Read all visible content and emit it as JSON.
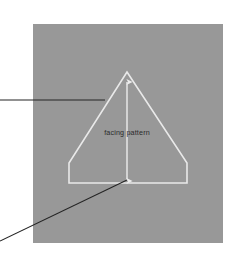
{
  "figure": {
    "panel": {
      "name": "gray-background-panel",
      "fill": "#989898",
      "x": 33,
      "y": 24,
      "width": 190,
      "height": 219
    },
    "shape": {
      "name": "facing-pattern-outline",
      "description": "triangle with truncated lower corners",
      "stroke": "#e9e9e9",
      "stroke_width": 1.6,
      "points": "127,72 187,163 187,183 69,183 69,163",
      "apex": {
        "x": 127,
        "y": 72
      },
      "base_y": 183,
      "base_left_x": 69,
      "base_right_x": 187,
      "shoulder_y": 163
    },
    "dimension_arrow": {
      "name": "height-dimension-arrow",
      "stroke": "#ededed",
      "stroke_width": 1.4,
      "x": 127,
      "y_top": 82,
      "y_bottom": 181,
      "double_headed": true,
      "label": "facing pattern",
      "label_x": 127,
      "label_y": 135,
      "label_color": "#2b2b2b",
      "label_font_size": 7.2
    },
    "leader_lines": [
      {
        "name": "leader-line-upper",
        "stroke": "#242424",
        "stroke_width": 1.1,
        "x1": 0,
        "y1": 100,
        "x2": 105,
        "y2": 100
      },
      {
        "name": "leader-line-lower",
        "stroke": "#242424",
        "stroke_width": 1.1,
        "x1": 0,
        "y1": 241,
        "x2": 127,
        "y2": 180
      }
    ]
  }
}
